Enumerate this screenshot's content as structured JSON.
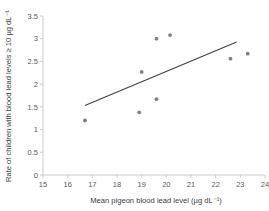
{
  "chart_data": {
    "type": "scatter",
    "title": "",
    "xlabel": "Mean pigeon blood lead level (µg dL⁻¹)",
    "ylabel": "Rate of children with blood lead levels ≥ 10 µg dL⁻¹",
    "xlim": [
      15,
      24
    ],
    "ylim": [
      0,
      3.5
    ],
    "xticks": [
      15,
      16,
      17,
      18,
      19,
      20,
      21,
      22,
      23,
      24
    ],
    "xtick_labels": [
      "15",
      "16",
      "17",
      "18",
      "19",
      "20",
      "21",
      "22",
      "23",
      "24"
    ],
    "yticks": [
      0,
      0.5,
      1,
      1.5,
      2,
      2.5,
      3,
      3.5
    ],
    "ytick_labels": [
      "0",
      "0.5",
      "1",
      "1.5",
      "2",
      "2.5",
      "3",
      "3.5"
    ],
    "grid": false,
    "legend": false,
    "marker_color": "#808080",
    "trendline_color": "#404040",
    "axis_color": "#bfbfbf",
    "points": [
      {
        "x": 16.7,
        "y": 1.2
      },
      {
        "x": 18.9,
        "y": 1.38
      },
      {
        "x": 19.0,
        "y": 2.27
      },
      {
        "x": 19.6,
        "y": 1.67
      },
      {
        "x": 19.6,
        "y": 3.0
      },
      {
        "x": 20.15,
        "y": 3.08
      },
      {
        "x": 22.6,
        "y": 2.56
      },
      {
        "x": 23.3,
        "y": 2.67
      }
    ],
    "trendline": {
      "x1": 16.7,
      "y1": 1.53,
      "x2": 22.85,
      "y2": 2.93
    }
  }
}
